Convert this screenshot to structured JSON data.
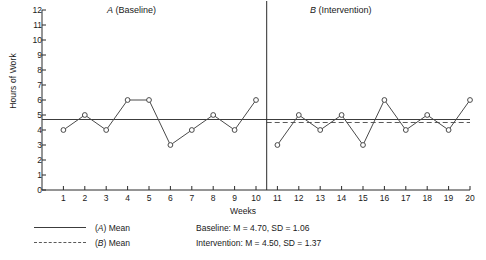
{
  "chart_data": {
    "type": "line",
    "title": "",
    "xlabel": "Weeks",
    "ylabel": "Hours of Work",
    "xlim": [
      0,
      20
    ],
    "ylim": [
      0,
      12
    ],
    "ytick_labels": [
      "0",
      "1",
      "2",
      "3",
      "4",
      "5",
      "6",
      "7",
      "8",
      "9",
      "10",
      "11",
      "12"
    ],
    "xtick_labels": [
      "1",
      "2",
      "3",
      "4",
      "5",
      "6",
      "7",
      "8",
      "9",
      "10",
      "11",
      "12",
      "13",
      "14",
      "15",
      "16",
      "17",
      "18",
      "19",
      "20"
    ],
    "grid": false,
    "legend_position": "below-left",
    "x": [
      1,
      2,
      3,
      4,
      5,
      6,
      7,
      8,
      9,
      10,
      11,
      12,
      13,
      14,
      15,
      16,
      17,
      18,
      19,
      20
    ],
    "series": [
      {
        "name": "A (Baseline)",
        "x": [
          1,
          2,
          3,
          4,
          5,
          6,
          7,
          8,
          9,
          10
        ],
        "values": [
          4,
          5,
          4,
          6,
          6,
          3,
          4,
          5,
          4,
          6
        ],
        "marker": "open-circle",
        "color": "#4a4a4a"
      },
      {
        "name": "B (Intervention)",
        "x": [
          11,
          12,
          13,
          14,
          15,
          16,
          17,
          18,
          19,
          20
        ],
        "values": [
          3,
          5,
          4,
          5,
          3,
          6,
          4,
          5,
          4,
          6
        ],
        "marker": "open-circle",
        "color": "#4a4a4a"
      }
    ],
    "reference_lines": [
      {
        "name": "(A) Mean",
        "value": 4.7,
        "style": "solid",
        "span": [
          0,
          20
        ],
        "color": "#3c3c3c"
      },
      {
        "name": "(B) Mean",
        "value": 4.5,
        "style": "dashed",
        "span": [
          10.5,
          20
        ],
        "color": "#5a5a5a"
      }
    ],
    "phase_divider_x": 10.5,
    "annotations": [
      {
        "text": "A (Baseline)",
        "x": 5.0,
        "y": 12.4
      },
      {
        "text": "B (Intervention)",
        "x": 15.0,
        "y": 12.4
      }
    ]
  },
  "phases": {
    "a_label_italic": "A",
    "a_label_rest": " (Baseline)",
    "b_label_italic": "B",
    "b_label_rest": " (Intervention)"
  },
  "axes": {
    "ylabel": "Hours of Work",
    "xlabel": "Weeks"
  },
  "legend": {
    "entry_a_italic": "A",
    "entry_a_text": "(",
    "entry_a_suffix": ") Mean",
    "entry_b_italic": "B",
    "entry_b_text": "(",
    "entry_b_suffix": ") Mean"
  },
  "stats": {
    "baseline": "Baseline: M = 4.70, SD = 1.06",
    "intervention": "Intervention: M = 4.50, SD = 1.37"
  },
  "colors": {
    "line": "#4a4a4a",
    "mean_a": "#3c3c3c",
    "mean_b": "#5a5a5a",
    "axis": "#2a2a2a",
    "background": "#ffffff"
  }
}
